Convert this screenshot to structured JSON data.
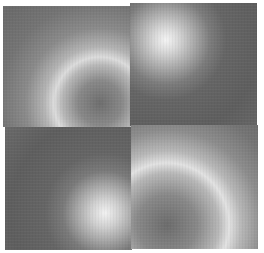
{
  "image": {
    "description": "2x2 mosaic of grayscale radial gradient tiles",
    "tiles": [
      {
        "position": "top-left",
        "pattern": "dark center, bright ring",
        "center_brightness": "dark"
      },
      {
        "position": "top-right",
        "pattern": "bright spot fading outward",
        "center_brightness": "bright"
      },
      {
        "position": "bottom-left",
        "pattern": "bright spot fading outward",
        "center_brightness": "bright"
      },
      {
        "position": "bottom-right",
        "pattern": "dark center, bright ring",
        "center_brightness": "dark"
      }
    ],
    "colors": {
      "background": "#ffffff",
      "dark_gray": "#5e5e5e",
      "mid_gray": "#888888",
      "highlight": "#f2f2f2"
    }
  }
}
